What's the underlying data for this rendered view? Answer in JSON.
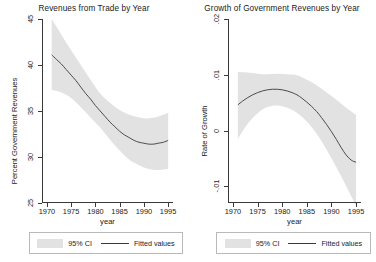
{
  "figure": {
    "background": "#ffffff",
    "band_color": "#e2e2e2",
    "line_color": "#3a3a3a",
    "axis_color": "#3a3a3a"
  },
  "legend": {
    "ci_label": "95% CI",
    "fit_label": "Fitted values"
  },
  "chart_data": [
    {
      "type": "line",
      "panel": "left",
      "title": "Revenues from Trade by Year",
      "xlabel": "year",
      "ylabel": "Percent Government Revenues",
      "xlim": [
        1969,
        1996
      ],
      "ylim": [
        25,
        45
      ],
      "xticks": [
        1970,
        1975,
        1980,
        1985,
        1990,
        1995
      ],
      "xticklabels": [
        "1970",
        "1975",
        "1980",
        "1985",
        "1990",
        "1995"
      ],
      "yticks": [
        25,
        30,
        35,
        40,
        45
      ],
      "yticklabels": [
        "25",
        "30",
        "35",
        "40",
        "45"
      ],
      "grid": false,
      "legend_position": "below",
      "series": [
        {
          "name": "Fitted values",
          "x": [
            1971,
            1972,
            1973,
            1974,
            1975,
            1976,
            1977,
            1978,
            1979,
            1980,
            1981,
            1982,
            1983,
            1984,
            1985,
            1986,
            1987,
            1988,
            1989,
            1990,
            1991,
            1992,
            1993,
            1994,
            1995
          ],
          "values": [
            41.1,
            40.6,
            40.1,
            39.5,
            38.9,
            38.3,
            37.6,
            36.9,
            36.3,
            35.6,
            35.0,
            34.4,
            33.8,
            33.3,
            32.8,
            32.4,
            32.1,
            31.8,
            31.6,
            31.5,
            31.4,
            31.4,
            31.5,
            31.6,
            31.8
          ]
        },
        {
          "name": "95% CI upper",
          "x": [
            1971,
            1973,
            1975,
            1977,
            1979,
            1981,
            1983,
            1985,
            1987,
            1989,
            1991,
            1993,
            1995
          ],
          "values": [
            45.0,
            43.3,
            41.6,
            40.0,
            38.4,
            36.9,
            35.9,
            35.1,
            34.6,
            34.3,
            34.2,
            34.4,
            34.8
          ]
        },
        {
          "name": "95% CI lower",
          "x": [
            1971,
            1973,
            1975,
            1977,
            1979,
            1981,
            1983,
            1985,
            1987,
            1989,
            1991,
            1993,
            1995
          ],
          "values": [
            37.3,
            37.0,
            36.4,
            35.4,
            34.3,
            33.2,
            31.9,
            30.7,
            29.7,
            29.1,
            28.7,
            28.6,
            28.7
          ]
        }
      ]
    },
    {
      "type": "line",
      "panel": "right",
      "title": "Growth of Government Revenues by Year",
      "xlabel": "year",
      "ylabel": "Rate of Growth",
      "xlim": [
        1969,
        1996
      ],
      "ylim": [
        -0.013,
        0.02
      ],
      "xticks": [
        1970,
        1975,
        1980,
        1985,
        1990,
        1995
      ],
      "xticklabels": [
        "1970",
        "1975",
        "1980",
        "1985",
        "1990",
        "1995"
      ],
      "yticks": [
        -0.01,
        0,
        0.01,
        0.02
      ],
      "yticklabels": [
        "-.01",
        "0",
        ".01",
        ".02"
      ],
      "grid": false,
      "legend_position": "below",
      "series": [
        {
          "name": "Fitted values",
          "x": [
            1971,
            1972,
            1973,
            1974,
            1975,
            1976,
            1977,
            1978,
            1979,
            1980,
            1981,
            1982,
            1983,
            1984,
            1985,
            1986,
            1987,
            1988,
            1989,
            1990,
            1991,
            1992,
            1993,
            1994,
            1995
          ],
          "values": [
            0.0046,
            0.0053,
            0.0059,
            0.0064,
            0.0068,
            0.0071,
            0.0073,
            0.0074,
            0.0074,
            0.0073,
            0.0071,
            0.0068,
            0.0064,
            0.0058,
            0.0051,
            0.0043,
            0.0034,
            0.0023,
            0.0011,
            -0.0002,
            -0.0016,
            -0.0031,
            -0.0044,
            -0.0053,
            -0.0057
          ]
        },
        {
          "name": "95% CI upper",
          "x": [
            1971,
            1973,
            1975,
            1977,
            1979,
            1981,
            1983,
            1985,
            1987,
            1989,
            1991,
            1993,
            1995
          ],
          "values": [
            0.0105,
            0.0104,
            0.0102,
            0.0101,
            0.0102,
            0.0101,
            0.0099,
            0.0091,
            0.0081,
            0.0068,
            0.0055,
            0.0041,
            0.0028
          ]
        },
        {
          "name": "95% CI lower",
          "x": [
            1971,
            1973,
            1975,
            1977,
            1979,
            1981,
            1983,
            1985,
            1987,
            1989,
            1991,
            1993,
            1995
          ],
          "values": [
            -0.0015,
            0.0012,
            0.0031,
            0.0042,
            0.0045,
            0.0041,
            0.0032,
            0.0016,
            -0.0006,
            -0.0034,
            -0.0066,
            -0.01,
            -0.0135
          ]
        }
      ]
    }
  ]
}
